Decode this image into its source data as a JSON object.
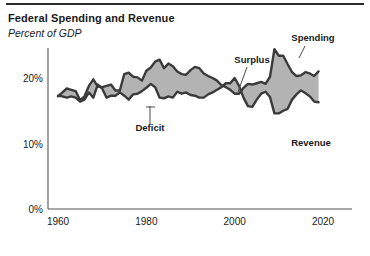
{
  "header": {
    "title": "Federal Spending and Revenue",
    "subtitle": "Percent of GDP"
  },
  "chart_data": {
    "type": "area",
    "title": "Federal Spending and Revenue",
    "subtitle": "Percent of GDP",
    "xlabel": "",
    "ylabel": "Percent of GDP",
    "xlim": [
      1960,
      2020
    ],
    "ylim": [
      0,
      24
    ],
    "grid": false,
    "legend_position": "inline-annotations",
    "y_ticks": [
      "0%",
      "10%",
      "20%"
    ],
    "y_tick_values": [
      0,
      10,
      20
    ],
    "x_ticks": [
      "1960",
      "1980",
      "2000",
      "2020"
    ],
    "x_tick_values": [
      1960,
      1980,
      2000,
      2020
    ],
    "annotations": [
      {
        "label": "Spending",
        "x": 2009,
        "y": 23.4
      },
      {
        "label": "Revenue",
        "x": 2012,
        "y": 14.6
      },
      {
        "label": "Surplus",
        "x": 1999,
        "y": 19.9
      },
      {
        "label": "Deficit",
        "x": 1983,
        "y": 16.1
      }
    ],
    "fill_color": "#b3b3b3",
    "line_color": "#3a3a3a",
    "x": [
      1960,
      1961,
      1962,
      1963,
      1964,
      1965,
      1966,
      1967,
      1968,
      1969,
      1970,
      1971,
      1972,
      1973,
      1974,
      1975,
      1976,
      1977,
      1978,
      1979,
      1980,
      1981,
      1982,
      1983,
      1984,
      1985,
      1986,
      1987,
      1988,
      1989,
      1990,
      1991,
      1992,
      1993,
      1994,
      1995,
      1996,
      1997,
      1998,
      1999,
      2000,
      2001,
      2002,
      2003,
      2004,
      2005,
      2006,
      2007,
      2008,
      2009,
      2010,
      2011,
      2012,
      2013,
      2014,
      2015,
      2016,
      2017,
      2018,
      2019
    ],
    "series": [
      {
        "name": "Spending",
        "values": [
          17.2,
          17.8,
          18.4,
          18.2,
          18.0,
          16.6,
          17.2,
          18.8,
          19.8,
          18.7,
          18.6,
          18.8,
          19.0,
          18.1,
          18.1,
          20.6,
          20.8,
          20.2,
          20.1,
          19.6,
          21.1,
          21.6,
          22.5,
          22.8,
          21.5,
          22.2,
          21.8,
          21.0,
          20.6,
          20.5,
          21.2,
          21.7,
          21.5,
          20.7,
          20.3,
          20.0,
          19.6,
          18.9,
          18.6,
          18.2,
          17.6,
          17.6,
          18.5,
          19.1,
          19.0,
          19.2,
          19.4,
          19.1,
          20.2,
          24.4,
          23.4,
          23.4,
          22.1,
          20.9,
          20.3,
          20.4,
          20.9,
          20.7,
          20.3,
          21.0
        ]
      },
      {
        "name": "Revenue",
        "values": [
          17.3,
          17.2,
          17.0,
          17.2,
          17.0,
          16.4,
          16.7,
          17.8,
          17.0,
          19.0,
          18.4,
          17.0,
          17.3,
          17.3,
          17.8,
          17.3,
          16.7,
          17.5,
          17.6,
          18.0,
          18.5,
          19.1,
          18.6,
          17.0,
          16.9,
          17.2,
          17.0,
          17.9,
          17.6,
          17.8,
          17.4,
          17.3,
          17.0,
          17.0,
          17.5,
          17.8,
          18.2,
          18.6,
          19.2,
          19.2,
          20.0,
          18.8,
          17.0,
          15.7,
          15.6,
          16.7,
          17.6,
          17.9,
          17.1,
          14.6,
          14.6,
          15.0,
          15.3,
          16.7,
          17.5,
          18.1,
          17.7,
          17.2,
          16.4,
          16.3
        ]
      }
    ]
  }
}
